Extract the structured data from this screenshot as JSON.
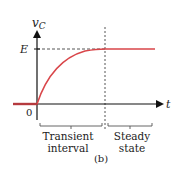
{
  "figure": {
    "caption": "(b)",
    "y_axis": {
      "label_main": "v",
      "label_sub": "C"
    },
    "x_axis": {
      "label": "t"
    },
    "origin_label": "0",
    "level_label": "E",
    "regions": [
      {
        "line1": "Transient",
        "line2": "interval"
      },
      {
        "line1": "Steady",
        "line2": "state"
      }
    ],
    "colors": {
      "curve": "#d9464a",
      "axis": "#111111",
      "dashed": "#555555"
    }
  }
}
